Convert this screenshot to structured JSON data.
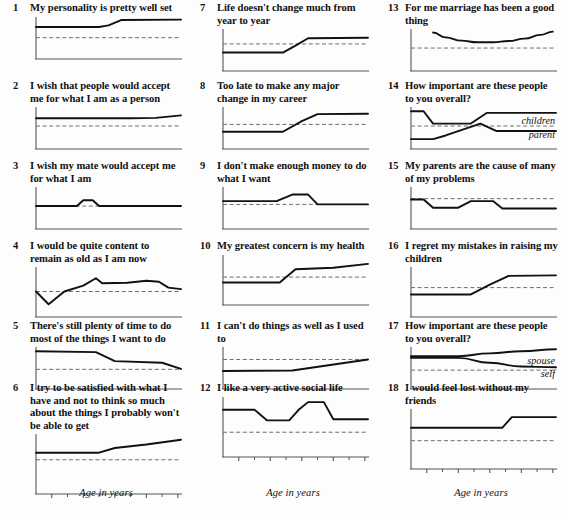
{
  "figure": {
    "width": 562,
    "height": 514,
    "background": "#fdfdfd",
    "ink": "#111111",
    "dash_color": "#6d6d6d",
    "axis_color": "#555555",
    "columns": 3,
    "rows": 6,
    "x_axis_label": "Age in years",
    "x_ticks_major": [
      20,
      30,
      40,
      50,
      60
    ],
    "x_ticks_minor": [
      25,
      35,
      45,
      55
    ],
    "x_range": [
      15,
      61
    ]
  },
  "chart_data": {
    "type": "line",
    "title": "",
    "xlabel": "Age in years",
    "ylabel": "",
    "xlim": [
      15,
      61
    ],
    "ylim": [
      0,
      1
    ],
    "grid": false,
    "legend": "inline-right",
    "reference_line": "dashed horizontal reference at y = 0.5",
    "panels": [
      {
        "number": "1",
        "title": "My personality is pretty well set",
        "column": 1,
        "row": 1,
        "refline": 0.52,
        "series": [
          {
            "name": "",
            "label": "",
            "x": [
              15,
              35,
              38,
              42,
              61
            ],
            "values": [
              0.78,
              0.78,
              0.82,
              0.95,
              0.96
            ]
          }
        ]
      },
      {
        "number": "2",
        "title": "I wish that people would accept me for what I am as a person",
        "column": 1,
        "row": 2,
        "refline": 0.56,
        "series": [
          {
            "name": "",
            "label": "",
            "x": [
              15,
              45,
              53,
              57,
              61
            ],
            "values": [
              0.75,
              0.75,
              0.76,
              0.79,
              0.82
            ]
          }
        ]
      },
      {
        "number": "3",
        "title": "I wish my mate would accept me for what I am",
        "column": 1,
        "row": 3,
        "refline": 0.56,
        "series": [
          {
            "name": "",
            "label": "",
            "x": [
              15,
              28,
              30,
              33,
              35,
              61
            ],
            "values": [
              0.56,
              0.56,
              0.7,
              0.7,
              0.56,
              0.56
            ]
          }
        ]
      },
      {
        "number": "4",
        "title": "I would be quite content to remain as old as I am now",
        "column": 1,
        "row": 4,
        "refline": 0.52,
        "series": [
          {
            "name": "",
            "label": "",
            "x": [
              15,
              19,
              24,
              30,
              34,
              36,
              44,
              50,
              54,
              57,
              61
            ],
            "values": [
              0.52,
              0.26,
              0.52,
              0.64,
              0.79,
              0.69,
              0.7,
              0.74,
              0.72,
              0.6,
              0.57
            ]
          }
        ]
      },
      {
        "number": "5",
        "title": "There's still plenty of time to do most of the things I want to do",
        "column": 1,
        "row": 5,
        "refline": 0.48,
        "series": [
          {
            "name": "",
            "label": "",
            "x": [
              15,
              34,
              40,
              55,
              61
            ],
            "values": [
              0.92,
              0.9,
              0.68,
              0.64,
              0.49
            ]
          }
        ]
      },
      {
        "number": "6",
        "title": "I try to be satisfied with what I have and not to think so much about the things I probably won't be able to get",
        "column": 1,
        "row": 6,
        "refline": 0.58,
        "series": [
          {
            "name": "",
            "label": "",
            "x": [
              15,
              35,
              40,
              50,
              61
            ],
            "values": [
              0.7,
              0.7,
              0.78,
              0.84,
              0.92
            ]
          }
        ]
      },
      {
        "number": "7",
        "title": "Life doesn't change much from year to year",
        "column": 2,
        "row": 1,
        "refline": 0.66,
        "series": [
          {
            "name": "",
            "label": "",
            "x": [
              15,
              34,
              38,
              42,
              61
            ],
            "values": [
              0.45,
              0.45,
              0.62,
              0.8,
              0.81
            ]
          }
        ]
      },
      {
        "number": "8",
        "title": "Too late to make any major change in my career",
        "column": 2,
        "row": 2,
        "refline": 0.6,
        "series": [
          {
            "name": "",
            "label": "",
            "x": [
              15,
              34,
              40,
              45,
              61
            ],
            "values": [
              0.42,
              0.42,
              0.68,
              0.85,
              0.86
            ]
          }
        ]
      },
      {
        "number": "9",
        "title": "I don't make enough money to do what I want",
        "column": 2,
        "row": 3,
        "refline": 0.6,
        "series": [
          {
            "name": "",
            "label": "",
            "x": [
              15,
              32,
              37,
              42,
              45,
              61
            ],
            "values": [
              0.68,
              0.68,
              0.84,
              0.84,
              0.6,
              0.6
            ]
          }
        ]
      },
      {
        "number": "10",
        "title": "My greatest concern is my health",
        "column": 2,
        "row": 4,
        "refline": 0.57,
        "series": [
          {
            "name": "",
            "label": "",
            "x": [
              15,
              33,
              38,
              50,
              61
            ],
            "values": [
              0.46,
              0.46,
              0.73,
              0.76,
              0.84
            ]
          }
        ]
      },
      {
        "number": "11",
        "title": "I can't do things as well as I used to",
        "column": 2,
        "row": 5,
        "refline": 0.72,
        "series": [
          {
            "name": "",
            "label": "",
            "x": [
              15,
              37,
              61
            ],
            "values": [
              0.44,
              0.45,
              0.72
            ]
          }
        ]
      },
      {
        "number": "12",
        "title": "I like a very active social life",
        "column": 2,
        "row": 6,
        "refline": 0.42,
        "series": [
          {
            "name": "",
            "label": "",
            "x": [
              15,
              25,
              29,
              36,
              39,
              42,
              47,
              50,
              53,
              61
            ],
            "values": [
              0.8,
              0.8,
              0.62,
              0.62,
              0.8,
              0.93,
              0.93,
              0.64,
              0.64,
              0.64
            ]
          }
        ]
      },
      {
        "number": "13",
        "title": "For me marriage has been a good thing",
        "column": 3,
        "row": 1,
        "refline": 0.56,
        "series": [
          {
            "name": "",
            "label": "",
            "x": [
              22,
              26,
              31,
              36,
              41,
              46,
              51,
              56,
              60
            ],
            "values": [
              0.94,
              0.82,
              0.74,
              0.7,
              0.7,
              0.73,
              0.79,
              0.88,
              0.96
            ]
          }
        ]
      },
      {
        "number": "14",
        "title": "How important are these people to you overall?",
        "column": 3,
        "row": 2,
        "refline": 0.56,
        "series": [
          {
            "name": "children",
            "label": "children",
            "x": [
              15,
              19,
              22,
              34,
              39,
              61
            ],
            "values": [
              0.92,
              0.92,
              0.62,
              0.62,
              0.88,
              0.88
            ]
          },
          {
            "name": "parent",
            "label": "parent",
            "x": [
              15,
              22,
              26,
              37,
              42,
              61
            ],
            "values": [
              0.24,
              0.24,
              0.33,
              0.62,
              0.44,
              0.44
            ]
          }
        ]
      },
      {
        "number": "15",
        "title": "My parents are the cause of many of my problems",
        "column": 3,
        "row": 3,
        "refline": 0.74,
        "series": [
          {
            "name": "",
            "label": "",
            "x": [
              15,
              19,
              22,
              30,
              34,
              37,
              41,
              44,
              61
            ],
            "values": [
              0.72,
              0.72,
              0.52,
              0.52,
              0.68,
              0.68,
              0.68,
              0.5,
              0.5
            ]
          }
        ]
      },
      {
        "number": "16",
        "title": "I regret my mistakes in raising my children",
        "column": 3,
        "row": 4,
        "refline": 0.6,
        "series": [
          {
            "name": "",
            "label": "",
            "x": [
              15,
              34,
              40,
              46,
              61
            ],
            "values": [
              0.46,
              0.46,
              0.66,
              0.84,
              0.85
            ]
          }
        ]
      },
      {
        "number": "17",
        "title": "How important are these people to you overall?",
        "column": 3,
        "row": 5,
        "refline": 0.46,
        "series": [
          {
            "name": "spouse",
            "label": "spouse",
            "x": [
              15,
              30,
              40,
              50,
              61
            ],
            "values": [
              0.8,
              0.8,
              0.87,
              0.92,
              0.97
            ]
          },
          {
            "name": "self",
            "label": "self",
            "x": [
              15,
              30,
              40,
              50,
              61
            ],
            "values": [
              0.76,
              0.76,
              0.64,
              0.55,
              0.53
            ]
          }
        ]
      },
      {
        "number": "18",
        "title": "I would feel lost without my friends",
        "column": 3,
        "row": 6,
        "refline": 0.48,
        "series": [
          {
            "name": "",
            "label": "",
            "x": [
              15,
              44,
              47,
              61
            ],
            "values": [
              0.7,
              0.7,
              0.88,
              0.88
            ]
          }
        ]
      }
    ]
  }
}
